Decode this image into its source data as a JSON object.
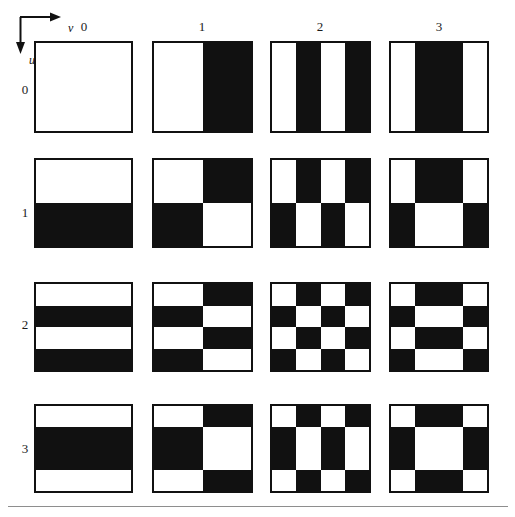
{
  "figure": {
    "axes": {
      "horizontal_label": "v",
      "vertical_label": "u",
      "horizontal_arrow_icon": "arrow-right-icon",
      "vertical_arrow_icon": "arrow-down-icon"
    },
    "column_labels": [
      "0",
      "1",
      "2",
      "3"
    ],
    "row_labels": [
      "0",
      "1",
      "2",
      "3"
    ],
    "colors": {
      "black": "#111111",
      "white": "#ffffff",
      "border": "#111111",
      "rule": "#8e8e8e",
      "background": "#ffffff"
    }
  },
  "chart_data": {
    "type": "heatmap",
    "xlabel": "v",
    "ylabel": "u",
    "legend": [],
    "grid": false,
    "x": [
      0,
      1,
      2,
      3
    ],
    "y": [
      0,
      1,
      2,
      3
    ],
    "basis_sequences": {
      "0": {
        "bands": 1,
        "widths": [
          1.0
        ],
        "values": [
          1
        ]
      },
      "1": {
        "bands": 2,
        "widths": [
          0.5,
          0.5
        ],
        "values": [
          1,
          -1
        ]
      },
      "2": {
        "bands": 4,
        "widths": [
          0.25,
          0.25,
          0.25,
          0.25
        ],
        "values": [
          1,
          -1,
          1,
          -1
        ]
      },
      "3": {
        "bands": 3,
        "widths": [
          0.25,
          0.5,
          0.25
        ],
        "values": [
          1,
          -1,
          1
        ]
      }
    },
    "tiles": [
      {
        "u": 0,
        "v": 0,
        "cols": [
          1.0
        ],
        "rows": [
          1.0
        ],
        "matrix": [
          [
            "w"
          ]
        ]
      },
      {
        "u": 0,
        "v": 1,
        "cols": [
          0.5,
          0.5
        ],
        "rows": [
          1.0
        ],
        "matrix": [
          [
            "w",
            "b"
          ]
        ]
      },
      {
        "u": 0,
        "v": 2,
        "cols": [
          0.25,
          0.25,
          0.25,
          0.25
        ],
        "rows": [
          1.0
        ],
        "matrix": [
          [
            "w",
            "b",
            "w",
            "b"
          ]
        ]
      },
      {
        "u": 0,
        "v": 3,
        "cols": [
          0.25,
          0.5,
          0.25
        ],
        "rows": [
          1.0
        ],
        "matrix": [
          [
            "w",
            "b",
            "w"
          ]
        ]
      },
      {
        "u": 1,
        "v": 0,
        "cols": [
          1.0
        ],
        "rows": [
          0.5,
          0.5
        ],
        "matrix": [
          [
            "w"
          ],
          [
            "b"
          ]
        ]
      },
      {
        "u": 1,
        "v": 1,
        "cols": [
          0.5,
          0.5
        ],
        "rows": [
          0.5,
          0.5
        ],
        "matrix": [
          [
            "w",
            "b"
          ],
          [
            "b",
            "w"
          ]
        ]
      },
      {
        "u": 1,
        "v": 2,
        "cols": [
          0.25,
          0.25,
          0.25,
          0.25
        ],
        "rows": [
          0.5,
          0.5
        ],
        "matrix": [
          [
            "w",
            "b",
            "w",
            "b"
          ],
          [
            "b",
            "w",
            "b",
            "w"
          ]
        ]
      },
      {
        "u": 1,
        "v": 3,
        "cols": [
          0.25,
          0.5,
          0.25
        ],
        "rows": [
          0.5,
          0.5
        ],
        "matrix": [
          [
            "w",
            "b",
            "w"
          ],
          [
            "b",
            "w",
            "b"
          ]
        ]
      },
      {
        "u": 2,
        "v": 0,
        "cols": [
          1.0
        ],
        "rows": [
          0.25,
          0.25,
          0.25,
          0.25
        ],
        "matrix": [
          [
            "w"
          ],
          [
            "b"
          ],
          [
            "w"
          ],
          [
            "b"
          ]
        ]
      },
      {
        "u": 2,
        "v": 1,
        "cols": [
          0.5,
          0.5
        ],
        "rows": [
          0.25,
          0.25,
          0.25,
          0.25
        ],
        "matrix": [
          [
            "w",
            "b"
          ],
          [
            "b",
            "w"
          ],
          [
            "w",
            "b"
          ],
          [
            "b",
            "w"
          ]
        ]
      },
      {
        "u": 2,
        "v": 2,
        "cols": [
          0.25,
          0.25,
          0.25,
          0.25
        ],
        "rows": [
          0.25,
          0.25,
          0.25,
          0.25
        ],
        "matrix": [
          [
            "w",
            "b",
            "w",
            "b"
          ],
          [
            "b",
            "w",
            "b",
            "w"
          ],
          [
            "w",
            "b",
            "w",
            "b"
          ],
          [
            "b",
            "w",
            "b",
            "w"
          ]
        ]
      },
      {
        "u": 2,
        "v": 3,
        "cols": [
          0.25,
          0.5,
          0.25
        ],
        "rows": [
          0.25,
          0.25,
          0.25,
          0.25
        ],
        "matrix": [
          [
            "w",
            "b",
            "w"
          ],
          [
            "b",
            "w",
            "b"
          ],
          [
            "w",
            "b",
            "w"
          ],
          [
            "b",
            "w",
            "b"
          ]
        ]
      },
      {
        "u": 3,
        "v": 0,
        "cols": [
          1.0
        ],
        "rows": [
          0.25,
          0.5,
          0.25
        ],
        "matrix": [
          [
            "w"
          ],
          [
            "b"
          ],
          [
            "w"
          ]
        ]
      },
      {
        "u": 3,
        "v": 1,
        "cols": [
          0.5,
          0.5
        ],
        "rows": [
          0.25,
          0.5,
          0.25
        ],
        "matrix": [
          [
            "w",
            "b"
          ],
          [
            "b",
            "w"
          ],
          [
            "w",
            "b"
          ]
        ]
      },
      {
        "u": 3,
        "v": 2,
        "cols": [
          0.25,
          0.25,
          0.25,
          0.25
        ],
        "rows": [
          0.25,
          0.5,
          0.25
        ],
        "matrix": [
          [
            "w",
            "b",
            "w",
            "b"
          ],
          [
            "b",
            "w",
            "b",
            "w"
          ],
          [
            "w",
            "b",
            "w",
            "b"
          ]
        ]
      },
      {
        "u": 3,
        "v": 3,
        "cols": [
          0.25,
          0.5,
          0.25
        ],
        "rows": [
          0.25,
          0.5,
          0.25
        ],
        "matrix": [
          [
            "w",
            "b",
            "w"
          ],
          [
            "b",
            "w",
            "b"
          ],
          [
            "w",
            "b",
            "w"
          ]
        ]
      }
    ]
  },
  "layout": {
    "tile_left": [
      34,
      152,
      270,
      389
    ],
    "tile_top": [
      41,
      158,
      282,
      404
    ],
    "tile_width": [
      99,
      101,
      101,
      100
    ],
    "tile_height": [
      92,
      90,
      90,
      89
    ],
    "col_label_x": [
      69,
      187,
      305,
      424
    ],
    "col_label_y": 20,
    "row_label_x": 15,
    "row_label_y": [
      83,
      206,
      318,
      442
    ]
  }
}
